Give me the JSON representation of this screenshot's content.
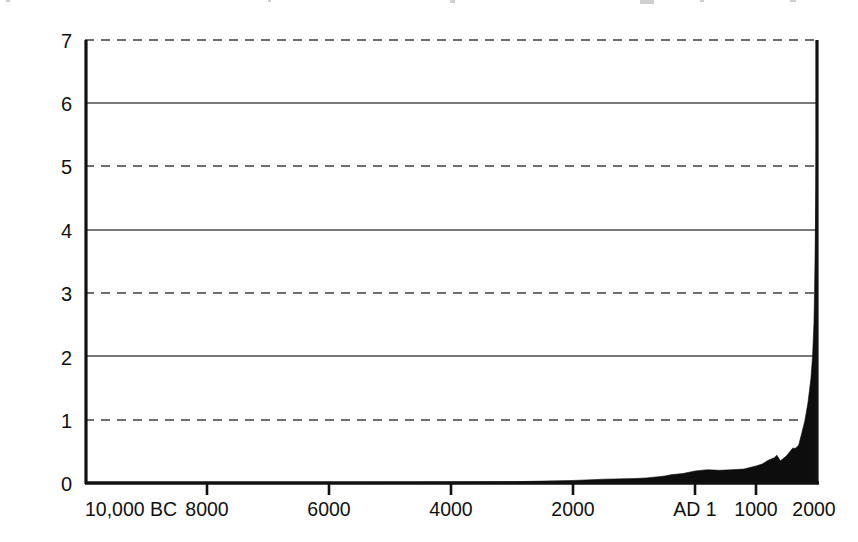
{
  "chart_data": {
    "type": "area",
    "title": "",
    "subtitle": "",
    "xlabel": "",
    "ylabel": "World population, billions",
    "grid": true,
    "legend_position": "none",
    "xlim": [
      -10000,
      2000
    ],
    "ylim": [
      0,
      7
    ],
    "y_ticks": [
      "0",
      "1",
      "2",
      "3",
      "4",
      "5",
      "6",
      "7"
    ],
    "y_tick_values": [
      0,
      1,
      2,
      3,
      4,
      5,
      6,
      7
    ],
    "y_gridline_styles": [
      "solid",
      "dashed",
      "solid",
      "dashed",
      "solid",
      "dashed",
      "solid",
      "dashed"
    ],
    "x_ticks": [
      "10,000 BC",
      "8000",
      "6000",
      "4000",
      "2000",
      "AD 1",
      "1000",
      "2000"
    ],
    "x_tick_values": [
      -10000,
      -8000,
      -6000,
      -4000,
      -2000,
      1,
      1000,
      2000
    ],
    "series": [
      {
        "name": "World population",
        "fill_color": "#0d0d0d",
        "x": [
          -10000,
          -9000,
          -8000,
          -7000,
          -6000,
          -5000,
          -4000,
          -3000,
          -2500,
          -2000,
          -1500,
          -1000,
          -800,
          -600,
          -500,
          -400,
          -200,
          1,
          200,
          400,
          600,
          800,
          1000,
          1100,
          1200,
          1300,
          1340,
          1400,
          1500,
          1600,
          1650,
          1700,
          1750,
          1800,
          1850,
          1900,
          1927,
          1950,
          1960,
          1970,
          1980,
          1987,
          1990,
          1999,
          2000
        ],
        "values": [
          0.004,
          0.005,
          0.005,
          0.006,
          0.007,
          0.01,
          0.015,
          0.02,
          0.03,
          0.04,
          0.06,
          0.07,
          0.08,
          0.1,
          0.11,
          0.13,
          0.15,
          0.19,
          0.21,
          0.2,
          0.21,
          0.22,
          0.27,
          0.3,
          0.36,
          0.4,
          0.44,
          0.35,
          0.43,
          0.55,
          0.55,
          0.6,
          0.79,
          0.98,
          1.26,
          1.65,
          2.0,
          2.52,
          3.03,
          3.7,
          4.44,
          5.0,
          5.28,
          6.0,
          6.09
        ]
      }
    ],
    "annotations": []
  },
  "axes": {
    "y_label_text": "World population, billions",
    "y_tick_labels": [
      "7",
      "6",
      "5",
      "4",
      "3",
      "2",
      "1",
      "0"
    ],
    "x_tick_labels": [
      "10,000 BC",
      "8000",
      "6000",
      "4000",
      "2000",
      "AD 1",
      "1000",
      "2000"
    ]
  },
  "style": {
    "axis_color": "#111111",
    "grid_solid_color": "#4d4d4d",
    "grid_dashed_color": "#6e6e6e",
    "area_color": "#0d0d0d",
    "background": "#ffffff"
  }
}
